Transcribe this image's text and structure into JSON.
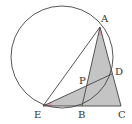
{
  "diagram": {
    "type": "geometry",
    "colors": {
      "stroke": "#444444",
      "shade": "#c4c4c4",
      "angle_mark": "#d99aa4",
      "background": "#ffffff"
    },
    "circle": {
      "cx": 62,
      "cy": 57,
      "r": 51
    },
    "points": {
      "A": {
        "x": 100,
        "y": 27,
        "label": "A"
      },
      "B": {
        "x": 82,
        "y": 106,
        "label": "B"
      },
      "C": {
        "x": 121,
        "y": 106,
        "label": "C"
      },
      "D": {
        "x": 112,
        "y": 74,
        "label": "D"
      },
      "E": {
        "x": 43,
        "y": 106,
        "label": "E"
      },
      "P": {
        "x": 88,
        "y": 86,
        "label": "P"
      }
    },
    "labels": [
      "A",
      "B",
      "C",
      "D",
      "E",
      "P"
    ],
    "segments": [
      "AE",
      "AB",
      "AC",
      "EC",
      "ED",
      "DC"
    ],
    "shaded_regions": [
      "triangle ABC",
      "triangle EDC"
    ],
    "angle_marks": [
      "angle at A (BAC)",
      "angle at E (DEC)"
    ]
  }
}
